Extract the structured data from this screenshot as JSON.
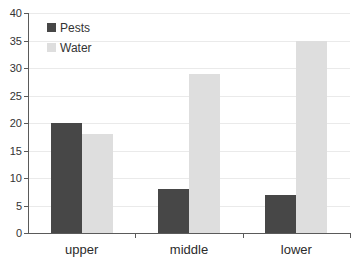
{
  "chart_data": {
    "type": "bar",
    "title": "",
    "xlabel": "",
    "ylabel": "",
    "categories": [
      "upper",
      "middle",
      "lower"
    ],
    "series": [
      {
        "name": "Pests",
        "color": "#474747",
        "values": [
          20,
          8,
          7
        ]
      },
      {
        "name": "Water",
        "color": "#dedede",
        "values": [
          18,
          29,
          35
        ]
      }
    ],
    "ylim": [
      0,
      40
    ],
    "ytick_step": 5,
    "ytick_labels": [
      "0",
      "5",
      "10",
      "15",
      "20",
      "25",
      "30",
      "35",
      "40"
    ],
    "grid": true,
    "legend_position": "top-left"
  },
  "colors": {
    "background": "#ffffff",
    "axis": "#5a5a5a",
    "gridline": "#eaeaea",
    "tick_text": "#333333",
    "category_text": "#2b2b2b",
    "pests_bar": "#474747",
    "water_bar": "#dedede"
  }
}
